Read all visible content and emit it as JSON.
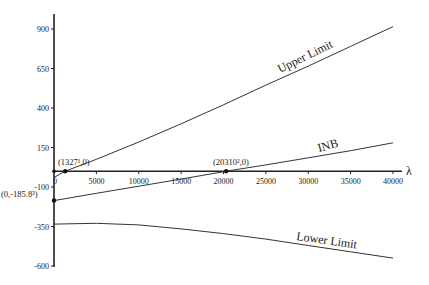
{
  "chart_data": {
    "type": "line",
    "title": "",
    "xlabel": "λ",
    "ylabel": "",
    "xlim": [
      0,
      40000
    ],
    "ylim": [
      -600,
      1000
    ],
    "x_ticks": [
      0,
      5000,
      10000,
      15000,
      20000,
      25000,
      30000,
      35000,
      40000
    ],
    "x_tick_labels": [
      "0",
      "5000",
      "10000",
      "15000",
      "20000",
      "25000",
      "30000",
      "35000",
      "40000"
    ],
    "y_ticks": [
      900,
      650,
      400,
      150,
      -100,
      -350,
      -600
    ],
    "y_tick_labels": [
      "900",
      "650",
      "400",
      "150",
      "-100",
      "-350",
      "-600"
    ],
    "grid": false,
    "legend": "none (inline labels)",
    "series": [
      {
        "name": "Upper Limit",
        "x": [
          0,
          1327,
          5000,
          10000,
          15000,
          20000,
          25000,
          30000,
          35000,
          40000
        ],
        "values": [
          -40,
          0,
          75,
          185,
          300,
          420,
          545,
          665,
          790,
          915
        ]
      },
      {
        "name": "INB",
        "x": [
          0,
          5000,
          10000,
          15000,
          20000,
          20310,
          25000,
          30000,
          35000,
          40000
        ],
        "values": [
          -185.8,
          -140,
          -95,
          -50,
          -3,
          0,
          40,
          85,
          130,
          180
        ]
      },
      {
        "name": "Lower Limit",
        "x": [
          0,
          5000,
          10000,
          15000,
          20000,
          25000,
          30000,
          35000,
          40000
        ],
        "values": [
          -335,
          -330,
          -340,
          -365,
          -395,
          -430,
          -470,
          -510,
          -550
        ]
      }
    ],
    "annotations": [
      {
        "text": "(1327¹,0)",
        "x": 1327,
        "y": 0
      },
      {
        "text": "(20310²,0)",
        "x": 20310,
        "y": 0
      },
      {
        "text": "(0,-185.8³)",
        "x": 0,
        "y": -185.8
      }
    ]
  }
}
